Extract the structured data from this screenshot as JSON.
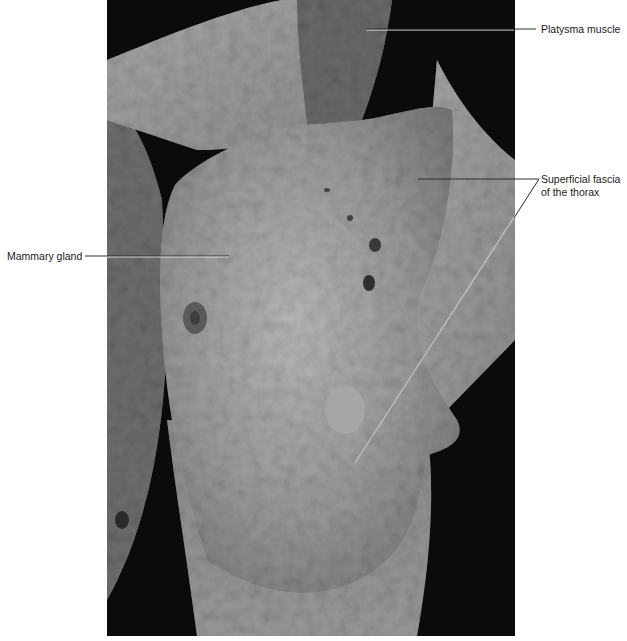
{
  "figure": {
    "colors": {
      "background": "#ffffff",
      "label_text": "#1a1a1a",
      "leader_line": "#1a1a1a",
      "leader_line_on_photo": "#f0f0f0"
    }
  },
  "labels": {
    "platysma": "Platysma muscle",
    "superficial_fascia_line1": "Superficial fascia",
    "superficial_fascia_line2": "of the thorax",
    "mammary_gland": "Mammary gland"
  }
}
